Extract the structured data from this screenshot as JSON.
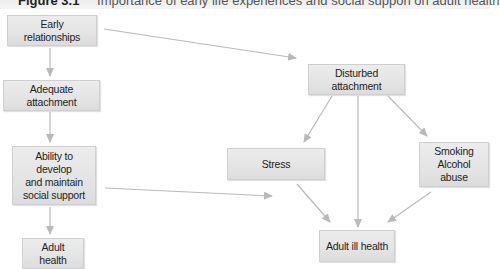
{
  "figure": {
    "number": "Figure 3.1",
    "title": "Importance of early life experiences and social suppon on adult health"
  },
  "nodes": {
    "early_relationships": "Early relationships",
    "adequate_attachment": "Adequate attachment",
    "ability_social_support": "Ability to develop\nand maintain\nsocial support",
    "adult_health": "Adult health",
    "disturbed_attachment": "Disturbed attachment",
    "stress": "Stress",
    "smoking_alcohol": "Smoking\nAlcohol abuse",
    "adult_ill_health": "Adult ill health"
  },
  "edges": [
    {
      "from": "Early relationships",
      "to": "Adequate attachment"
    },
    {
      "from": "Adequate attachment",
      "to": "Ability to develop and maintain social support"
    },
    {
      "from": "Ability to develop and maintain social support",
      "to": "Adult health"
    },
    {
      "from": "Early relationships",
      "to": "Disturbed attachment"
    },
    {
      "from": "Disturbed attachment",
      "to": "Stress"
    },
    {
      "from": "Disturbed attachment",
      "to": "Adult ill health"
    },
    {
      "from": "Disturbed attachment",
      "to": "Smoking Alcohol abuse"
    },
    {
      "from": "Stress",
      "to": "Adult ill health"
    },
    {
      "from": "Smoking Alcohol abuse",
      "to": "Adult ill health"
    },
    {
      "from": "Ability to develop and maintain social support",
      "to": "Adult ill health (toward)"
    }
  ],
  "colors": {
    "box_fill": "#e4e4e4",
    "box_border": "#cfcfcf",
    "arrow": "#b9b9b9",
    "text": "#1e1e1e"
  }
}
